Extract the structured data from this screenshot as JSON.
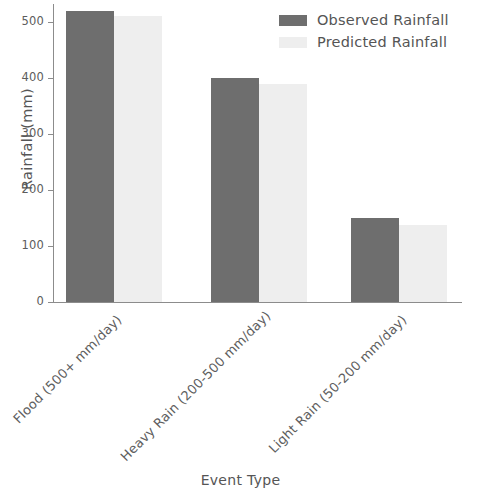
{
  "chart_data": {
    "type": "bar",
    "title": "",
    "xlabel": "Event Type",
    "ylabel": "Rainfall (mm)",
    "categories": [
      "Flood (500+ mm/day)",
      "Heavy Rain (200-500 mm/day)",
      "Light Rain (50-200 mm/day)"
    ],
    "series": [
      {
        "name": "Observed Rainfall",
        "values": [
          520,
          400,
          150
        ],
        "color": "#6e6e6e"
      },
      {
        "name": "Predicted Rainfall",
        "values": [
          510,
          390,
          138
        ],
        "color": "#eeeeee"
      }
    ],
    "ylim": [
      0,
      535
    ],
    "yticks": [
      0,
      100,
      200,
      300,
      400,
      500
    ],
    "ytick_labels": [
      "0",
      "100",
      "200",
      "300",
      "400",
      "500"
    ],
    "grid": false,
    "legend_position": "top-right",
    "xtick_rotation": -45
  },
  "legend": {
    "entries": [
      {
        "label": "Observed Rainfall",
        "swatch_color": "#6e6e6e"
      },
      {
        "label": "Predicted Rainfall",
        "swatch_color": "#eeeeee"
      }
    ]
  },
  "axes": {
    "y_title": "Rainfall (mm)",
    "x_title": "Event Type",
    "axis_color": "#8c8c8c",
    "tick_text_color": "#5c5c5c"
  }
}
